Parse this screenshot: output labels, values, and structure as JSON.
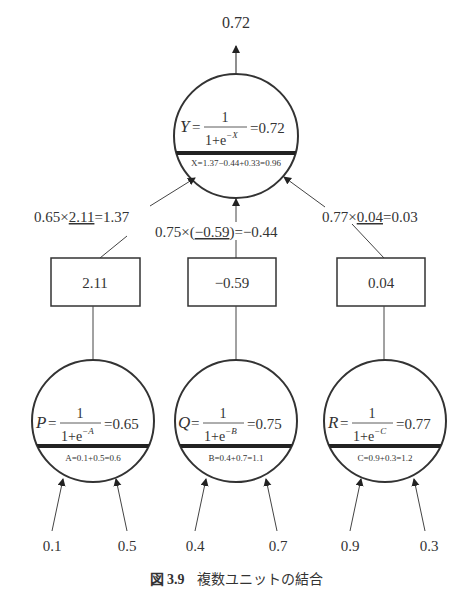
{
  "output": {
    "value": "0.72"
  },
  "units": {
    "Y": {
      "lhs": "Y",
      "numerator": "1",
      "denominator_base": "1+e",
      "exponent": "−X",
      "result": "0.72",
      "sum_expr": "X=1.37−0.44+0.33=0.96"
    },
    "P": {
      "lhs": "P",
      "numerator": "1",
      "denominator_base": "1+e",
      "exponent": "−A",
      "result": "0.65",
      "sum_expr": "A=0.1+0.5=0.6"
    },
    "Q": {
      "lhs": "Q",
      "numerator": "1",
      "denominator_base": "1+e",
      "exponent": "−B",
      "result": "0.75",
      "sum_expr": "B=0.4+0.7=1.1"
    },
    "R": {
      "lhs": "R",
      "numerator": "1",
      "denominator_base": "1+e",
      "exponent": "−C",
      "result": "0.77",
      "sum_expr": "C=0.9+0.3=1.2"
    }
  },
  "weights": [
    {
      "value": "2.11",
      "expr_pre": "0.65×",
      "expr_weight": "2.11",
      "expr_post": "=1.37"
    },
    {
      "value": "−0.59",
      "expr_pre": "0.75×(",
      "expr_weight": "−0.59",
      "expr_post": ")=−0.44"
    },
    {
      "value": "0.04",
      "expr_pre": "0.77×",
      "expr_weight": "0.04",
      "expr_post": "=0.03"
    }
  ],
  "inputs": [
    {
      "value": "0.1"
    },
    {
      "value": "0.5"
    },
    {
      "value": "0.4"
    },
    {
      "value": "0.7"
    },
    {
      "value": "0.9"
    },
    {
      "value": "0.3"
    }
  ],
  "caption": {
    "label": "図 3.9",
    "text": "複数ユニットの結合"
  },
  "colors": {
    "stroke": "#333333",
    "bar": "#222222",
    "text": "#333333"
  }
}
